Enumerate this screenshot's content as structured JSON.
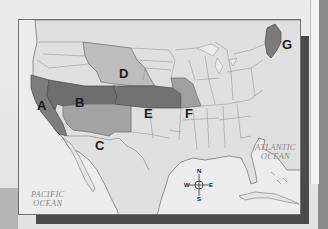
{
  "map": {
    "title": "United States regions map",
    "regions": [
      {
        "id": "A",
        "label": "A",
        "color": "#7d7d7d"
      },
      {
        "id": "B",
        "label": "B",
        "color": "#6e6e6e"
      },
      {
        "id": "C",
        "label": "C",
        "color": "#a3a3a3"
      },
      {
        "id": "D",
        "label": "D",
        "color": "#bdbdbd"
      },
      {
        "id": "E",
        "label": "E",
        "color": "#727272"
      },
      {
        "id": "F",
        "label": "F",
        "color": "#a0a0a0"
      },
      {
        "id": "G",
        "label": "G",
        "color": "#7a7a7a"
      }
    ],
    "oceans": {
      "pacific_line1": "PACIFIC",
      "pacific_line2": "OCEAN",
      "atlantic_line1": "ATLANTIC",
      "atlantic_line2": "OCEAN"
    },
    "compass": {
      "n": "N",
      "s": "S",
      "e": "E",
      "w": "W"
    },
    "colors": {
      "land": "#e0e0e0",
      "water": "#ededed",
      "border": "#6f6f6f",
      "shadow": "#4a4a4a"
    }
  }
}
